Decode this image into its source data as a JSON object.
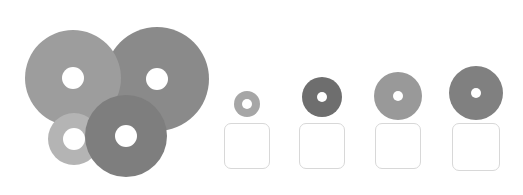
{
  "canvas": {
    "width": 523,
    "height": 195,
    "background": "#ffffff"
  },
  "cluster": {
    "name": "overlapping-disc-cluster",
    "discs": [
      {
        "id": "disc-large-light",
        "label": "Large light gray annulus",
        "cx": 73,
        "cy": 78,
        "r": 48,
        "hole_r": 11,
        "color": "#9d9d9d",
        "z": 2
      },
      {
        "id": "disc-large-dark",
        "label": "Large medium gray annulus",
        "cx": 157,
        "cy": 79,
        "r": 52,
        "hole_r": 11,
        "color": "#8a8a8a",
        "z": 1
      },
      {
        "id": "disc-small-pale",
        "label": "Small pale gray annulus",
        "cx": 74,
        "cy": 139,
        "r": 26,
        "hole_r": 11,
        "color": "#b4b4b4",
        "z": 3
      },
      {
        "id": "disc-medium-dark",
        "label": "Medium dark gray annulus",
        "cx": 126,
        "cy": 136,
        "r": 41,
        "hole_r": 11,
        "color": "#7e7e7e",
        "z": 4
      }
    ]
  },
  "samples": {
    "name": "sample-row",
    "items": [
      {
        "id": "sample-1",
        "label": "Sample 1",
        "disc": {
          "cx": 247,
          "cy": 104,
          "r": 13,
          "hole_r": 5,
          "color": "#a6a6a6"
        },
        "swatch": {
          "x": 224,
          "y": 123,
          "w": 46,
          "h": 46,
          "fill": "#ffffff",
          "border": "#d8d8d8"
        }
      },
      {
        "id": "sample-2",
        "label": "Sample 2",
        "disc": {
          "cx": 322,
          "cy": 97,
          "r": 20,
          "hole_r": 5,
          "color": "#6e6e6e"
        },
        "swatch": {
          "x": 299,
          "y": 123,
          "w": 46,
          "h": 46,
          "fill": "#ffffff",
          "border": "#d8d8d8"
        }
      },
      {
        "id": "sample-3",
        "label": "Sample 3",
        "disc": {
          "cx": 398,
          "cy": 96,
          "r": 24,
          "hole_r": 5,
          "color": "#999999"
        },
        "swatch": {
          "x": 375,
          "y": 123,
          "w": 46,
          "h": 46,
          "fill": "#ffffff",
          "border": "#d8d8d8"
        }
      },
      {
        "id": "sample-4",
        "label": "Sample 4",
        "disc": {
          "cx": 476,
          "cy": 93,
          "r": 27,
          "hole_r": 5,
          "color": "#808080"
        },
        "swatch": {
          "x": 452,
          "y": 123,
          "w": 48,
          "h": 48,
          "fill": "#ffffff",
          "border": "#d8d8d8"
        }
      }
    ]
  }
}
